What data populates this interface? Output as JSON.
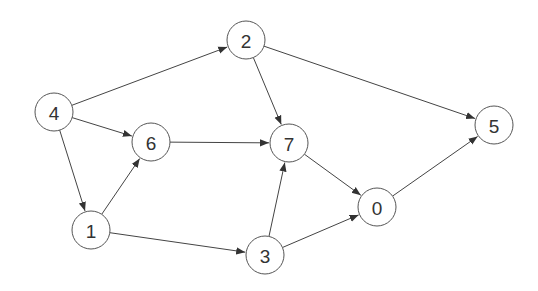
{
  "graph": {
    "type": "directed",
    "node_radius": 19,
    "nodes": [
      {
        "id": "4",
        "label": "4",
        "x": 54,
        "y": 112
      },
      {
        "id": "2",
        "label": "2",
        "x": 246,
        "y": 40
      },
      {
        "id": "6",
        "label": "6",
        "x": 151,
        "y": 142
      },
      {
        "id": "7",
        "label": "7",
        "x": 289,
        "y": 143
      },
      {
        "id": "5",
        "label": "5",
        "x": 494,
        "y": 125
      },
      {
        "id": "1",
        "label": "1",
        "x": 91,
        "y": 230
      },
      {
        "id": "3",
        "label": "3",
        "x": 265,
        "y": 255
      },
      {
        "id": "0",
        "label": "0",
        "x": 377,
        "y": 207
      }
    ],
    "edges": [
      {
        "from": "4",
        "to": "2"
      },
      {
        "from": "4",
        "to": "6"
      },
      {
        "from": "4",
        "to": "1"
      },
      {
        "from": "2",
        "to": "7"
      },
      {
        "from": "2",
        "to": "5"
      },
      {
        "from": "6",
        "to": "7"
      },
      {
        "from": "1",
        "to": "6"
      },
      {
        "from": "1",
        "to": "3"
      },
      {
        "from": "3",
        "to": "7"
      },
      {
        "from": "3",
        "to": "0"
      },
      {
        "from": "7",
        "to": "0"
      },
      {
        "from": "0",
        "to": "5"
      }
    ]
  }
}
